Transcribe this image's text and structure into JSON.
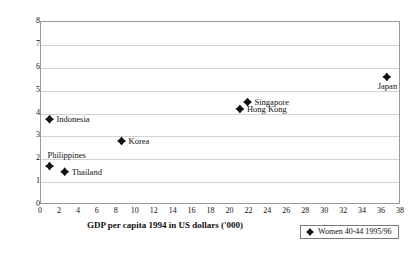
{
  "chart_data": {
    "type": "scatter",
    "title": "",
    "xlabel": "GDP per capita 1994 in US dollars ('000)",
    "ylabel": "Percent divorced in age group",
    "xlim": [
      0,
      38
    ],
    "ylim": [
      0,
      8
    ],
    "xticks": [
      0,
      2,
      4,
      6,
      8,
      10,
      12,
      14,
      16,
      18,
      20,
      22,
      24,
      26,
      28,
      30,
      32,
      34,
      36,
      38
    ],
    "yticks": [
      0,
      1,
      2,
      3,
      4,
      5,
      6,
      7,
      8
    ],
    "grid": "horizontal",
    "legend_position": "bottom-right",
    "legend": [
      {
        "label": "Women 40-44 1995/96",
        "marker": "diamond",
        "color": "#111111"
      }
    ],
    "series": [
      {
        "name": "Women 40-44 1995/96",
        "points": [
          {
            "label": "Indonesia",
            "x": 0.9,
            "y": 3.75,
            "label_pos": "right"
          },
          {
            "label": "Philippines",
            "x": 0.9,
            "y": 1.7,
            "label_pos": "above"
          },
          {
            "label": "Thailand",
            "x": 2.5,
            "y": 1.45,
            "label_pos": "right"
          },
          {
            "label": "Korea",
            "x": 8.5,
            "y": 2.8,
            "label_pos": "right"
          },
          {
            "label": "Hong Kong",
            "x": 21.0,
            "y": 4.2,
            "label_pos": "right"
          },
          {
            "label": "Singapore",
            "x": 21.8,
            "y": 4.5,
            "label_pos": "right"
          },
          {
            "label": "Japan",
            "x": 36.5,
            "y": 5.6,
            "label_pos": "below"
          }
        ]
      }
    ]
  }
}
